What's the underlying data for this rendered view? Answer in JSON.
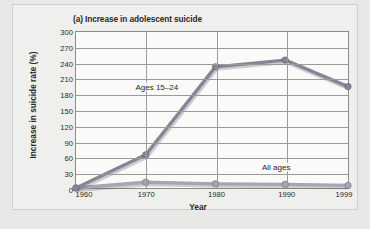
{
  "figure": {
    "label": "increase-in-adolescent-suicide-figure",
    "panel_letter": "(a)",
    "background_color": "#efefed",
    "plot_background_color": "#fafaf8",
    "grid_color": "#9a9a96"
  },
  "chart_data": {
    "type": "line",
    "title": "(a) Increase in adolescent suicide",
    "xlabel": "Year",
    "ylabel": "Increase in suicide rate (%)",
    "x": [
      1960,
      1970,
      1980,
      1990,
      1999
    ],
    "xtick_labels": [
      "1960",
      "1970",
      "1980",
      "1990",
      "1999"
    ],
    "xlim": [
      1960,
      1999
    ],
    "ylim": [
      0,
      300
    ],
    "ytick_labels": [
      "0",
      "30",
      "60",
      "90",
      "120",
      "150",
      "180",
      "210",
      "240",
      "270",
      "300"
    ],
    "yticks": [
      0,
      30,
      60,
      90,
      120,
      150,
      180,
      210,
      240,
      270,
      300
    ],
    "grid": "horizontal-and-vertical",
    "legend_position": "inline-annotations",
    "series": [
      {
        "name": "Ages 15-24",
        "annotation": "Ages 15–24",
        "color": "#8a8396",
        "marker": "circle",
        "values": [
          0,
          64,
          233,
          246,
          195
        ]
      },
      {
        "name": "All ages",
        "annotation": "All ages",
        "color": "#a9a3b2",
        "marker": "circle",
        "values": [
          0,
          11,
          8,
          7,
          5
        ]
      }
    ],
    "annotations": [
      {
        "text": "Ages 15–24",
        "x": 1971.5,
        "y": 196
      },
      {
        "text": "All ages",
        "x": 1988.5,
        "y": 43
      }
    ]
  }
}
